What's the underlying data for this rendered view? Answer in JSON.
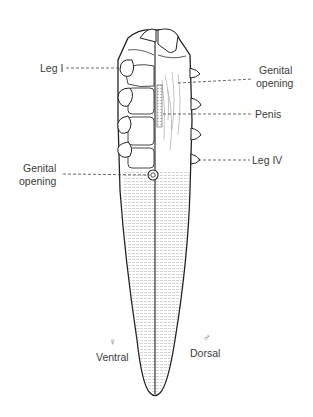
{
  "diagram": {
    "left_half": {
      "view": "Ventral",
      "sex_symbol": "♀"
    },
    "right_half": {
      "view": "Dorsal",
      "sex_symbol": "♂"
    },
    "labels": {
      "leg_i": "Leg I",
      "genital_opening_right_line1": "Genital",
      "genital_opening_right_line2": "opening",
      "penis": "Penis",
      "leg_iv": "Leg IV",
      "genital_opening_left_line1": "Genital",
      "genital_opening_left_line2": "opening",
      "ventral": "Ventral",
      "dorsal": "Dorsal",
      "female_symbol": "♀",
      "male_symbol": "♂"
    },
    "colors": {
      "line": "#2a2a2a",
      "text": "#3c3c3c",
      "background": "#ffffff"
    }
  }
}
